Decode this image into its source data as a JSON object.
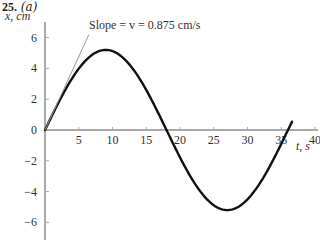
{
  "problem": {
    "number": "25.",
    "part": "(a)"
  },
  "chart_data": {
    "type": "line",
    "title": "",
    "xlabel": "t, s",
    "ylabel": "x, cm",
    "xlim": [
      0,
      40
    ],
    "ylim": [
      -6,
      6
    ],
    "x_ticks": [
      5,
      10,
      15,
      20,
      25,
      30,
      35,
      40
    ],
    "y_ticks": [
      6,
      4,
      2,
      0,
      -2,
      -4,
      -6
    ],
    "x_tick_labels": [
      "5",
      "10",
      "15",
      "20",
      "25",
      "30",
      "35",
      "40"
    ],
    "y_tick_labels": [
      "6",
      "4",
      "2",
      "0",
      "−2",
      "−4",
      "−6"
    ],
    "grid": false,
    "series": [
      {
        "name": "x(t)",
        "function": "x = 5.2 sin(2π t / 36)",
        "amplitude_cm": 5.2,
        "period_s": 36,
        "x": [
          0,
          4.5,
          9,
          13.5,
          18,
          22.5,
          27,
          31.5,
          36,
          36.5
        ],
        "values": [
          0,
          3.68,
          5.2,
          3.68,
          0,
          -3.68,
          -5.2,
          -3.68,
          0,
          0.45
        ]
      },
      {
        "name": "tangent at t=0",
        "style": "thin gray line",
        "x": [
          0,
          6.5
        ],
        "values": [
          0,
          6.2
        ]
      }
    ],
    "annotations": [
      {
        "text": "Slope = v = 0.875 cm/s",
        "points_to": "tangent at origin"
      }
    ]
  },
  "labels": {
    "annotation": "Slope = v = 0.875 cm/s",
    "x_axis": "t, s",
    "y_axis": "x, cm"
  }
}
